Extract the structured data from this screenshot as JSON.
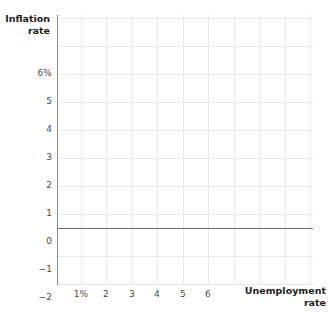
{
  "chart_data": {
    "type": "line",
    "title": "",
    "subtitle": "",
    "xlabel": "Unemployment rate",
    "ylabel": "Inflation rate",
    "xlabel_lines": [
      "Unemployment",
      "rate"
    ],
    "ylabel_lines": [
      "Inflation",
      "rate"
    ],
    "x_tick_labels": [
      "1%",
      "2",
      "3",
      "4",
      "5",
      "6"
    ],
    "x_tick_values": [
      1,
      2,
      3,
      4,
      5,
      6
    ],
    "y_tick_labels": [
      "6%",
      "5",
      "4",
      "3",
      "2",
      "1",
      "0",
      "-1",
      "-2"
    ],
    "y_tick_values": [
      6,
      5,
      4,
      3,
      2,
      1,
      0,
      -1,
      -2
    ],
    "xlim": [
      0.3,
      10.3
    ],
    "ylim": [
      -2,
      6.6
    ],
    "grid": true,
    "legend": null,
    "series": [],
    "values": [],
    "annotations": [],
    "note": "Empty plotting grid; no data series are drawn. Horizontal zero axis is emphasized."
  },
  "axes": {
    "y_title_line1": "Inflation",
    "y_title_line2": "rate",
    "x_title_line1": "Unemployment",
    "x_title_line2": "rate",
    "y_ticks": [
      {
        "label": "6%",
        "top": 68
      },
      {
        "label": "5",
        "top": 96
      },
      {
        "label": "4",
        "top": 124
      },
      {
        "label": "3",
        "top": 152
      },
      {
        "label": "2",
        "top": 180
      },
      {
        "label": "1",
        "top": 208
      },
      {
        "label": "0",
        "top": 236
      },
      {
        "label": "−1",
        "top": 264
      },
      {
        "label": "−2",
        "top": 292
      }
    ],
    "x_ticks": [
      {
        "label": "1%",
        "left": 81
      },
      {
        "label": "2",
        "left": 106
      },
      {
        "label": "3",
        "left": 132
      },
      {
        "label": "4",
        "left": 157
      },
      {
        "label": "5",
        "left": 183
      },
      {
        "label": "6",
        "left": 208
      }
    ]
  },
  "grid": {
    "vertical_positions": [
      24,
      49,
      75,
      100,
      126,
      151,
      177,
      202,
      228,
      253
    ],
    "horizontal_positions": [
      3,
      31,
      59,
      87,
      115,
      143,
      171,
      199,
      241,
      269
    ]
  },
  "colors": {
    "background": "#ffffff",
    "gridline": "#e9e9ea",
    "axis_line": "#8a8a8c",
    "zero_axis_line": "#6e6e70",
    "tick_text": "#4b4b4d",
    "title_text": "#1c1c1e"
  }
}
